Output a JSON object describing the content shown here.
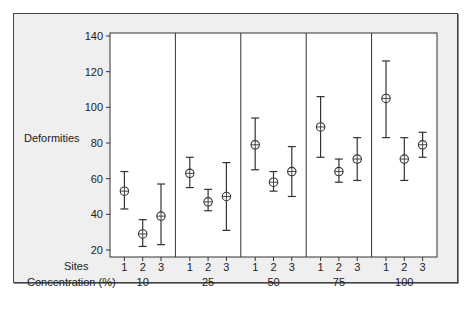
{
  "chart_data": {
    "type": "interval",
    "title": "",
    "ylabel": "Deformities",
    "xlabel_rows": [
      "Sites",
      "Concentration (%)"
    ],
    "ylim": [
      15,
      142
    ],
    "yticks": [
      20,
      40,
      60,
      80,
      100,
      120,
      140
    ],
    "grid": false,
    "legend": null,
    "groups": [
      {
        "concentration": "10",
        "sites": [
          {
            "site": "1",
            "mean": 53,
            "low": 43,
            "high": 64
          },
          {
            "site": "2",
            "mean": 29,
            "low": 22,
            "high": 37
          },
          {
            "site": "3",
            "mean": 39,
            "low": 23,
            "high": 57
          }
        ]
      },
      {
        "concentration": "25",
        "sites": [
          {
            "site": "1",
            "mean": 63,
            "low": 55,
            "high": 72
          },
          {
            "site": "2",
            "mean": 47,
            "low": 42,
            "high": 54
          },
          {
            "site": "3",
            "mean": 50,
            "low": 31,
            "high": 69
          }
        ]
      },
      {
        "concentration": "50",
        "sites": [
          {
            "site": "1",
            "mean": 79,
            "low": 65,
            "high": 94
          },
          {
            "site": "2",
            "mean": 58,
            "low": 53,
            "high": 64
          },
          {
            "site": "3",
            "mean": 64,
            "low": 50,
            "high": 78
          }
        ]
      },
      {
        "concentration": "75",
        "sites": [
          {
            "site": "1",
            "mean": 89,
            "low": 72,
            "high": 106
          },
          {
            "site": "2",
            "mean": 64,
            "low": 58,
            "high": 71
          },
          {
            "site": "3",
            "mean": 71,
            "low": 59,
            "high": 83
          }
        ]
      },
      {
        "concentration": "100",
        "sites": [
          {
            "site": "1",
            "mean": 105,
            "low": 83,
            "high": 126
          },
          {
            "site": "2",
            "mean": 71,
            "low": 59,
            "high": 83
          },
          {
            "site": "3",
            "mean": 79,
            "low": 72,
            "high": 86
          }
        ]
      }
    ]
  },
  "labels": {
    "ylabel": "Deformities",
    "sites_row": "Sites",
    "conc_row": "Concentration (%)"
  },
  "colors": {
    "frame_bg": "#efefef",
    "plot_bg": "#ffffff",
    "ink": "#333333"
  }
}
